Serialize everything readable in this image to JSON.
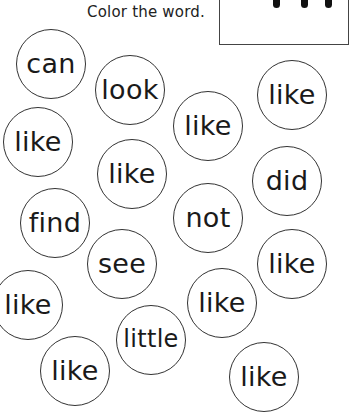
{
  "header": {
    "instruction": "Color the word."
  },
  "word_box": {
    "strokes_visible": 3
  },
  "bubbles": [
    {
      "word": "can",
      "cx": 51,
      "cy": 64
    },
    {
      "word": "look",
      "cx": 130,
      "cy": 90
    },
    {
      "word": "like",
      "cx": 292,
      "cy": 95
    },
    {
      "word": "like",
      "cx": 208,
      "cy": 126
    },
    {
      "word": "like",
      "cx": 38,
      "cy": 142
    },
    {
      "word": "like",
      "cx": 132,
      "cy": 174
    },
    {
      "word": "did",
      "cx": 287,
      "cy": 181
    },
    {
      "word": "find",
      "cx": 55,
      "cy": 223
    },
    {
      "word": "not",
      "cx": 208,
      "cy": 218
    },
    {
      "word": "see",
      "cx": 122,
      "cy": 264
    },
    {
      "word": "like",
      "cx": 292,
      "cy": 264
    },
    {
      "word": "like",
      "cx": 28,
      "cy": 305
    },
    {
      "word": "like",
      "cx": 222,
      "cy": 303
    },
    {
      "word": "little",
      "cx": 151,
      "cy": 340
    },
    {
      "word": "like",
      "cx": 75,
      "cy": 371
    },
    {
      "word": "like",
      "cx": 264,
      "cy": 377
    }
  ]
}
